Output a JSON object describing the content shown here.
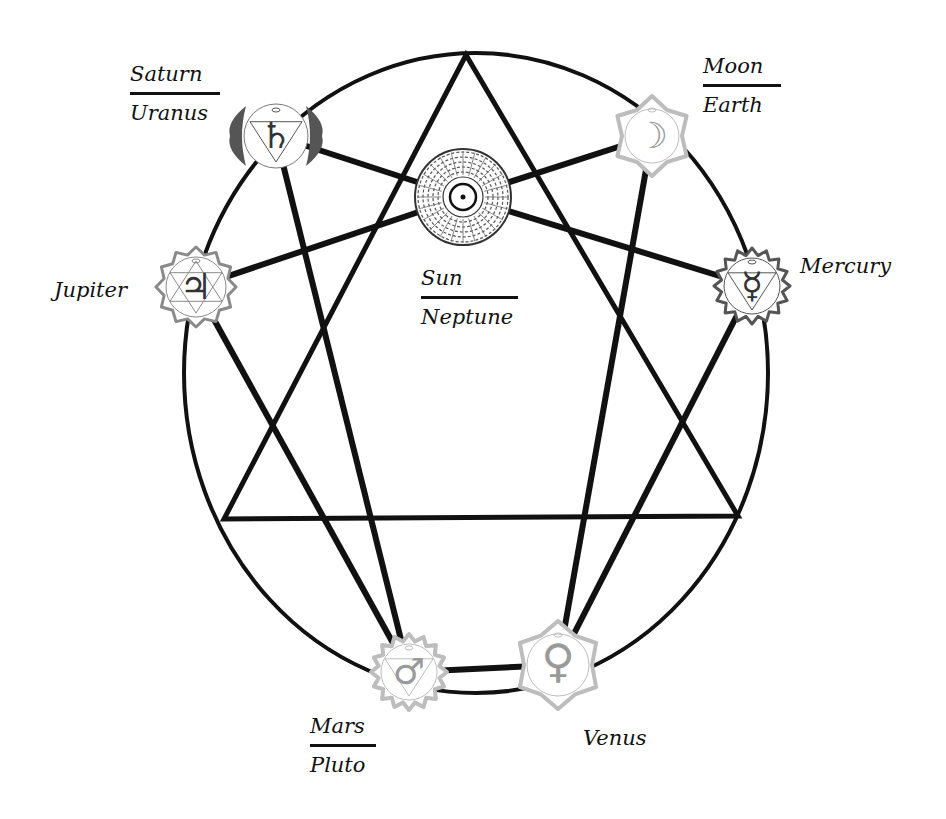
{
  "diagram": {
    "colors": {
      "background": "#ffffff",
      "line": "#111111",
      "chakra_dark": "#555555",
      "chakra_mid": "#8a8a8a",
      "chakra_light": "#bdbdbd"
    },
    "circle": {
      "cx": 476,
      "cy": 373,
      "rx": 292,
      "ry": 320
    },
    "triangle": [
      [
        466,
        55
      ],
      [
        224,
        519
      ],
      [
        738,
        516
      ]
    ],
    "nodes": [
      {
        "id": "saturn",
        "x": 276,
        "y": 136,
        "r": 40,
        "symbol": "♄",
        "style": "dark"
      },
      {
        "id": "sun",
        "x": 463,
        "y": 197,
        "r": 48,
        "symbol": "☉",
        "style": "mandala"
      },
      {
        "id": "moon",
        "x": 652,
        "y": 136,
        "r": 40,
        "symbol": "☽",
        "style": "light"
      },
      {
        "id": "jupiter",
        "x": 196,
        "y": 287,
        "r": 40,
        "symbol": "♃",
        "style": "mid"
      },
      {
        "id": "mercury",
        "x": 752,
        "y": 286,
        "r": 38,
        "symbol": "☿",
        "style": "dark"
      },
      {
        "id": "mars",
        "x": 409,
        "y": 672,
        "r": 38,
        "symbol": "♂",
        "style": "light"
      },
      {
        "id": "venus",
        "x": 558,
        "y": 665,
        "r": 44,
        "symbol": "♀",
        "style": "light"
      }
    ],
    "connections": [
      [
        "saturn",
        "sun"
      ],
      [
        "sun",
        "moon"
      ],
      [
        "sun",
        "jupiter"
      ],
      [
        "sun",
        "mercury"
      ],
      [
        "saturn",
        "mars"
      ],
      [
        "jupiter",
        "mars"
      ],
      [
        "moon",
        "venus"
      ],
      [
        "mercury",
        "venus"
      ],
      [
        "mars",
        "venus"
      ]
    ]
  },
  "labels": {
    "saturn_uranus": {
      "top": "Saturn",
      "bottom": "Uranus"
    },
    "moon_earth": {
      "top": "Moon",
      "bottom": "Earth"
    },
    "sun_neptune": {
      "top": "Sun",
      "bottom": "Neptune"
    },
    "jupiter": "Jupiter",
    "mercury": "Mercury",
    "mars_pluto": {
      "top": "Mars",
      "bottom": "Pluto"
    },
    "venus": "Venus"
  }
}
